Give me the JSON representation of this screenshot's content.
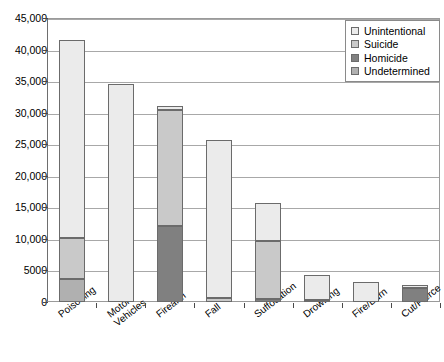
{
  "chart_data": {
    "type": "bar",
    "subtype": "stacked",
    "title": "",
    "xlabel": "",
    "ylabel": "",
    "ylim": [
      0,
      45000
    ],
    "grid": true,
    "legend_position": "top-right",
    "categories": [
      "Poisoning",
      "Motor Vehicles",
      "Firearm",
      "Fall",
      "Suffocation",
      "Drowning",
      "Fire/Burn",
      "Cut/Pierce"
    ],
    "category_lines": [
      [
        "Poisoning"
      ],
      [
        "Motor",
        "Vehicles"
      ],
      [
        "Firearm"
      ],
      [
        "Fall"
      ],
      [
        "Suffocation"
      ],
      [
        "Drowning"
      ],
      [
        "Fire/Burn"
      ],
      [
        "Cut/Pierce"
      ]
    ],
    "ytick_labels": [
      "0",
      "5000",
      "10,000",
      "15,000",
      "20,000",
      "25,000",
      "30,000",
      "35,000",
      "40,000",
      "45,000"
    ],
    "ytick_values": [
      0,
      5000,
      10000,
      15000,
      20000,
      25000,
      30000,
      35000,
      40000,
      45000
    ],
    "series": [
      {
        "name": "Undetermined",
        "color": "#b0b0b0",
        "values": [
          3600,
          0,
          0,
          0,
          0,
          0,
          0,
          0
        ]
      },
      {
        "name": "Homicide",
        "color": "#808080",
        "values": [
          0,
          0,
          12000,
          0,
          400,
          300,
          0,
          2200
        ]
      },
      {
        "name": "Suicide",
        "color": "#c9c9c9",
        "values": [
          6500,
          0,
          18400,
          700,
          9300,
          0,
          0,
          0
        ]
      },
      {
        "name": "Unintentional",
        "color": "#ebebeb",
        "values": [
          31400,
          34600,
          600,
          24900,
          6000,
          4000,
          3200,
          500
        ]
      }
    ],
    "totals": [
      41500,
      34600,
      31000,
      25600,
      15700,
      4300,
      3200,
      2700
    ]
  },
  "legend": {
    "items": [
      {
        "label": "Unintentional",
        "color": "#ebebeb"
      },
      {
        "label": "Suicide",
        "color": "#c9c9c9"
      },
      {
        "label": "Homicide",
        "color": "#808080"
      },
      {
        "label": "Undetermined",
        "color": "#b0b0b0"
      }
    ]
  }
}
